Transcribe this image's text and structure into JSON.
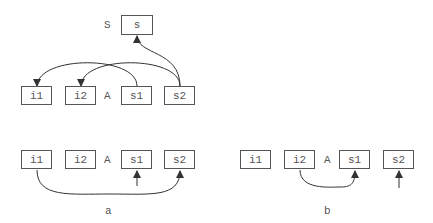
{
  "top": {
    "struct_label": "S",
    "struct_box": "s",
    "array_label": "A",
    "boxes": [
      "i1",
      "i2",
      "s1",
      "s2"
    ]
  },
  "panel_a": {
    "array_label": "A",
    "boxes": [
      "i1",
      "i2",
      "s1",
      "s2"
    ],
    "caption": "a"
  },
  "panel_b": {
    "array_label": "A",
    "boxes": [
      "i1",
      "i2",
      "s1",
      "s2"
    ],
    "caption": "b"
  },
  "colors": {
    "stroke": "#555555",
    "text": "#555555",
    "background": "#ffffff"
  }
}
